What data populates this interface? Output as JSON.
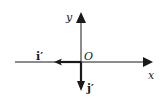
{
  "diagram": {
    "type": "coordinate-axes",
    "colors": {
      "ink": "#1a1a1a",
      "background": "#ffffff"
    },
    "axes": {
      "x_label": "x",
      "y_label": "y",
      "origin_label": "O"
    },
    "vectors": [
      {
        "label": "i′",
        "direction": "negative-x"
      },
      {
        "label": "j′",
        "direction": "negative-y"
      }
    ]
  }
}
